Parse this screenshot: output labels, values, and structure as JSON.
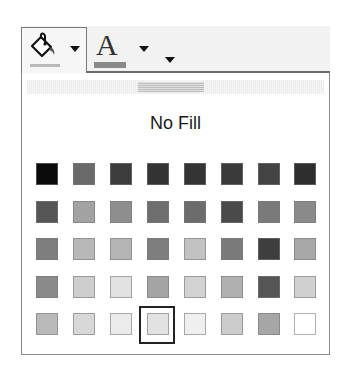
{
  "toolbar": {
    "fill_color_button": {
      "icon": "paint-bucket-icon",
      "tooltip": "",
      "current_color": "#b8b8b8"
    },
    "fill_color_dropdown": {
      "icon": "chevron-down-icon"
    },
    "font_color_button": {
      "icon": "font-color-icon",
      "letter": "A",
      "current_color": "#8a8a8a"
    },
    "font_color_dropdown": {
      "icon": "chevron-down-icon"
    },
    "overflow_dropdown": {
      "icon": "chevron-down-icon"
    }
  },
  "popup": {
    "grip": "drag-handle",
    "no_fill_label": "No Fill",
    "selected": {
      "row": 4,
      "col": 3
    },
    "swatches": [
      [
        "#0a0a0a",
        "#6a6a6a",
        "#3c3c3c",
        "#333333",
        "#343434",
        "#3a3a3a",
        "#444444",
        "#2e2e2e"
      ],
      [
        "#555555",
        "#a2a2a2",
        "#8e8e8e",
        "#6e6e6e",
        "#6c6c6c",
        "#4a4a4a",
        "#7a7a7a",
        "#8a8a8a"
      ],
      [
        "#7e7e7e",
        "#b8b8b8",
        "#b4b4b4",
        "#7e7e7e",
        "#c2c2c2",
        "#7a7a7a",
        "#3e3e3e",
        "#a8a8a8"
      ],
      [
        "#8a8a8a",
        "#cdcdcd",
        "#e2e2e2",
        "#a4a4a4",
        "#d2d2d2",
        "#b0b0b0",
        "#555555",
        "#d0d0d0"
      ],
      [
        "#b9b9b9",
        "#d8d8d8",
        "#ececec",
        "#e2e2e2",
        "#efefef",
        "#cccccc",
        "#a6a6a6",
        "#ffffff"
      ]
    ]
  }
}
